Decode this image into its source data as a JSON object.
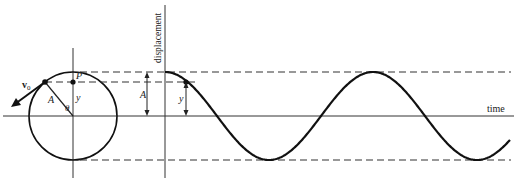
{
  "diagram": {
    "labels": {
      "velocity": "v",
      "velocity_sub": "0",
      "point": "P",
      "radius": "A",
      "angle": "θ",
      "projection": "y",
      "amplitude": "A",
      "displacement_y": "y",
      "y_axis": "displacement",
      "x_axis": "time"
    },
    "colors": {
      "line": "#222222",
      "curve": "#111111",
      "dashed": "#333333",
      "background": "#ffffff"
    },
    "circle": {
      "cx": 73,
      "cy": 116,
      "r": 44
    },
    "axes": {
      "time_axis_y": 116,
      "displacement_axis_x": 165
    },
    "wave": {
      "type": "cosine",
      "start_x": 165,
      "end_x": 510,
      "center_y": 116,
      "amplitude_px": 44,
      "period_px": 208
    }
  }
}
